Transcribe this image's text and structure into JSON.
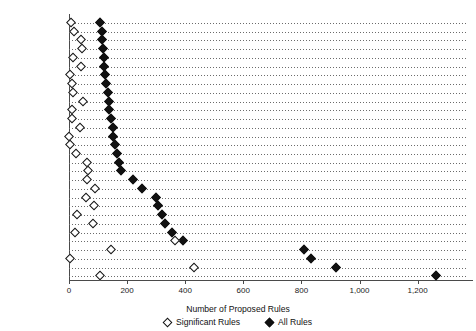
{
  "chart_data": {
    "type": "scatter",
    "title": "",
    "xlabel": "Number of Proposed Rules",
    "ylabel": "",
    "xlim": [
      0,
      1370
    ],
    "xticks": [
      0,
      200,
      400,
      600,
      800,
      1000,
      1200
    ],
    "xticklabels": [
      "0",
      "200",
      "400",
      "600",
      "800",
      "1,000",
      "1,200"
    ],
    "grid": "horizontal-dotted",
    "legend_position": "bottom",
    "series": [
      {
        "name": "Significant Rules",
        "marker": "open-diamond",
        "color": "#111111"
      },
      {
        "name": "All Rules",
        "marker": "filled-diamond",
        "color": "#111111"
      }
    ],
    "categories": [
      "CG (DOT)",
      "PTO (DOC)",
      "FARM (USDA)",
      "FNS (USDA)",
      "BOEM (DOI)",
      "DEPT (DOD)",
      "DEPT (DOT)",
      "NPS (DOI)",
      "GSA",
      "HOUSING (HUD)",
      "FHA (HUD)",
      "COMP (TREAS)",
      "EERE (DOE)",
      "ATTTB (TREAS)",
      "AMS (USDA)",
      "PHMSA (DOT)",
      "SBA",
      "SSA",
      "APHIS (USDA)",
      "FDA (HHS)",
      "FAA (DOT)",
      "OPM",
      "NHTSA (DOT)",
      "VA",
      "DARC (DOD)",
      "CMS (HHS)",
      "FWS (DOI)",
      "IRS (TREAS)",
      "EPA",
      "NOAA (DOC)"
    ],
    "points": [
      {
        "label": "CG (DOT)",
        "significant": 8,
        "all": 108
      },
      {
        "label": "PTO (DOC)",
        "significant": 16,
        "all": 113
      },
      {
        "label": "FARM (USDA)",
        "significant": 42,
        "all": 115
      },
      {
        "label": "FNS (USDA)",
        "significant": 44,
        "all": 117
      },
      {
        "label": "BOEM (DOI)",
        "significant": 14,
        "all": 119
      },
      {
        "label": "DEPT (DOD)",
        "significant": 42,
        "all": 122
      },
      {
        "label": "DEPT (DOT)",
        "significant": 2,
        "all": 125
      },
      {
        "label": "NPS (DOI)",
        "significant": 12,
        "all": 129
      },
      {
        "label": "GSA",
        "significant": 13,
        "all": 133
      },
      {
        "label": "HOUSING (HUD)",
        "significant": 47,
        "all": 136
      },
      {
        "label": "FHA (HUD)",
        "significant": 10,
        "all": 139
      },
      {
        "label": "COMP (TREAS)",
        "significant": 11,
        "all": 146
      },
      {
        "label": "EERE (DOE)",
        "significant": 37,
        "all": 150
      },
      {
        "label": "ATTTB (TREAS)",
        "significant": 1,
        "all": 153
      },
      {
        "label": "AMS (USDA)",
        "significant": 5,
        "all": 160
      },
      {
        "label": "PHMSA (DOT)",
        "significant": 25,
        "all": 166
      },
      {
        "label": "SBA",
        "significant": 61,
        "all": 173
      },
      {
        "label": "SSA",
        "significant": 66,
        "all": 179
      },
      {
        "label": "APHIS (USDA)",
        "significant": 61,
        "all": 222
      },
      {
        "label": "FDA (HHS)",
        "significant": 91,
        "all": 250
      },
      {
        "label": "FAA (DOT)",
        "significant": 59,
        "all": 300
      },
      {
        "label": "OPM",
        "significant": 86,
        "all": 307
      },
      {
        "label": "NHTSA (DOT)",
        "significant": 29,
        "all": 320
      },
      {
        "label": "VA",
        "significant": 82,
        "all": 331
      },
      {
        "label": "DARC (DOD)",
        "significant": 21,
        "all": 353
      },
      {
        "label": "CMS (HHS)",
        "significant": 366,
        "all": 394
      },
      {
        "label": "FWS (DOI)",
        "significant": 144,
        "all": 810
      },
      {
        "label": "IRS (TREAS)",
        "significant": 3,
        "all": 834
      },
      {
        "label": "EPA",
        "significant": 430,
        "all": 919
      },
      {
        "label": "NOAA (DOC)",
        "significant": 107,
        "all": 1265
      }
    ]
  },
  "legend": {
    "significant_label": "Significant Rules",
    "all_label": "All Rules"
  }
}
